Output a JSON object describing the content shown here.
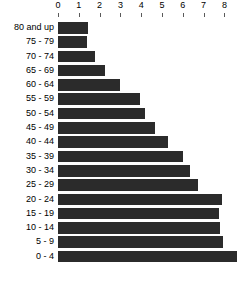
{
  "chart_data": {
    "type": "bar",
    "orientation": "horizontal",
    "title": "",
    "subtitle": "",
    "xlabel": "",
    "ylabel": "",
    "xlim": [
      0,
      9
    ],
    "grid": false,
    "legend": null,
    "legend_position": "none",
    "bar_color": "#2b2b2b",
    "axis_position": "top",
    "xticks": [
      "0",
      "1",
      "2",
      "3",
      "4",
      "5",
      "6",
      "7",
      "8",
      "9"
    ],
    "xtick_values": [
      0,
      1,
      2,
      3,
      4,
      5,
      6,
      7,
      8,
      9
    ],
    "categories": [
      "80 and up",
      "75 - 79",
      "70 - 74",
      "65 - 69",
      "60 - 64",
      "55 - 59",
      "50 - 54",
      "45 - 49",
      "40 - 44",
      "35 - 39",
      "30 - 34",
      "25 - 29",
      "20 - 24",
      "15 - 19",
      "10 - 14",
      "5 - 9",
      "0 - 4"
    ],
    "values": [
      1.45,
      1.4,
      1.8,
      2.25,
      3.0,
      3.95,
      4.2,
      4.65,
      5.3,
      6.0,
      6.35,
      6.75,
      7.9,
      7.75,
      7.8,
      7.95,
      8.6
    ]
  }
}
